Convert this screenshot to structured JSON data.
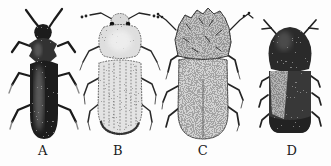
{
  "figure": {
    "description_colors": {
      "background": "#fdfdfd",
      "ink": "#1b1b1b",
      "light_body": "#e3e3e3",
      "medium_body": "#d2d2d2",
      "dark_body": "#222222"
    },
    "specimens": [
      {
        "label": "A",
        "shade": "dark"
      },
      {
        "label": "B",
        "shade": "light"
      },
      {
        "label": "C",
        "shade": "medium"
      },
      {
        "label": "D",
        "shade": "dark"
      }
    ]
  }
}
